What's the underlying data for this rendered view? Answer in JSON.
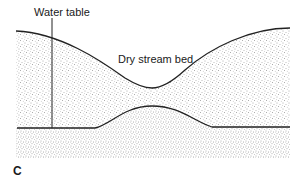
{
  "figure": {
    "panel_label": "C",
    "labels": {
      "water_table": "Water table",
      "dry_stream_bed": "Dry stream bed"
    },
    "colors": {
      "line": "#222222",
      "stipple_dot": "#555555",
      "background": "#ffffff"
    }
  }
}
